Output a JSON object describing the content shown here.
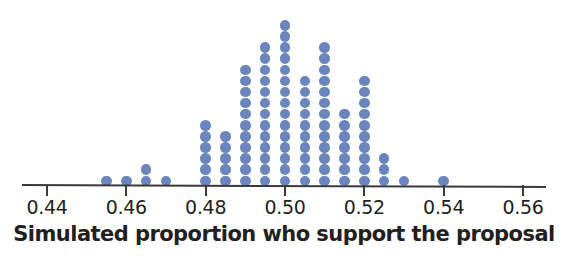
{
  "chart_data": {
    "type": "scatter",
    "plot_style": "dotplot",
    "title": "",
    "xlabel": "Simulated proportion who support the proposal",
    "ylabel": "",
    "xlim": [
      0.432,
      0.568
    ],
    "ylim": [
      0,
      15
    ],
    "grid": false,
    "legend": null,
    "axis_ticks": [
      "0.44",
      "0.46",
      "0.48",
      "0.50",
      "0.52",
      "0.54",
      "0.56"
    ],
    "axis_tick_values": [
      0.44,
      0.46,
      0.48,
      0.5,
      0.52,
      0.54,
      0.56
    ],
    "bin_width": 0.005,
    "dot_color": "#6b85bd",
    "axis_color": "#3a3a3a",
    "text_color": "#231f20",
    "x": [
      0.455,
      0.46,
      0.465,
      0.47,
      0.48,
      0.485,
      0.49,
      0.495,
      0.5,
      0.505,
      0.51,
      0.515,
      0.52,
      0.525,
      0.53,
      0.54
    ],
    "counts": [
      1,
      1,
      2,
      1,
      6,
      5,
      11,
      13,
      15,
      10,
      13,
      7,
      10,
      3,
      1,
      1
    ],
    "total_dots": 100,
    "points": [
      {
        "value": 0.455,
        "count": 1
      },
      {
        "value": 0.46,
        "count": 1
      },
      {
        "value": 0.465,
        "count": 2
      },
      {
        "value": 0.47,
        "count": 1
      },
      {
        "value": 0.48,
        "count": 6
      },
      {
        "value": 0.485,
        "count": 5
      },
      {
        "value": 0.49,
        "count": 11
      },
      {
        "value": 0.495,
        "count": 13
      },
      {
        "value": 0.5,
        "count": 15
      },
      {
        "value": 0.505,
        "count": 10
      },
      {
        "value": 0.51,
        "count": 13
      },
      {
        "value": 0.515,
        "count": 7
      },
      {
        "value": 0.52,
        "count": 10
      },
      {
        "value": 0.525,
        "count": 3
      },
      {
        "value": 0.53,
        "count": 1
      },
      {
        "value": 0.54,
        "count": 1
      }
    ]
  }
}
